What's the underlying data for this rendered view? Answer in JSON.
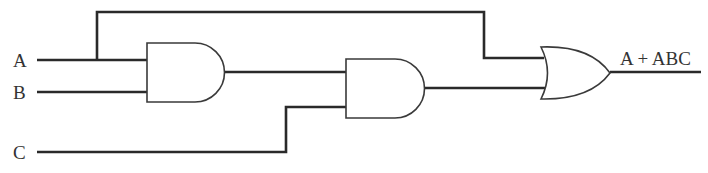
{
  "diagram": {
    "type": "logic-circuit",
    "inputs": [
      {
        "id": "A",
        "label": "A"
      },
      {
        "id": "B",
        "label": "B"
      },
      {
        "id": "C",
        "label": "C"
      }
    ],
    "gates": [
      {
        "id": "and1",
        "type": "AND",
        "inputs": [
          "A",
          "B"
        ]
      },
      {
        "id": "and2",
        "type": "AND",
        "inputs": [
          "and1",
          "C"
        ]
      },
      {
        "id": "or1",
        "type": "OR",
        "inputs": [
          "A",
          "and2"
        ]
      }
    ],
    "output": {
      "label": "A + ABC",
      "source": "or1"
    },
    "colors": {
      "line": "#2a2a2a",
      "background": "#ffffff",
      "text": "#333333"
    }
  }
}
